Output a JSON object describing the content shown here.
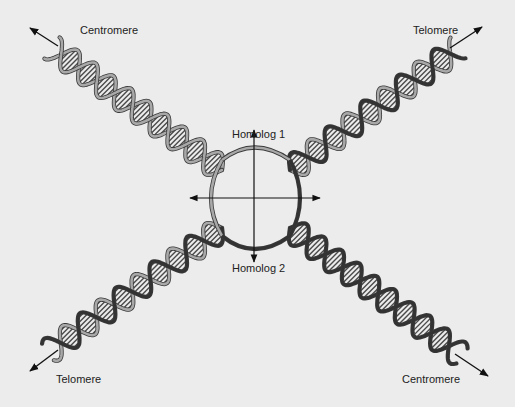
{
  "diagram": {
    "labels": {
      "top_left": "Centromere",
      "top_right": "Telomere",
      "bottom_left": "Telomere",
      "bottom_right": "Centromere",
      "homolog_1": "Homolog 1",
      "homolog_2": "Homolog 2"
    },
    "arms": [
      {
        "id": "arm-top-left",
        "end_label": "Centromere",
        "strand_shading": "light"
      },
      {
        "id": "arm-top-right",
        "end_label": "Telomere",
        "strand_shading": "mixed"
      },
      {
        "id": "arm-bottom-left",
        "end_label": "Telomere",
        "strand_shading": "mixed"
      },
      {
        "id": "arm-bottom-right",
        "end_label": "Centromere",
        "strand_shading": "dark"
      }
    ],
    "axes": {
      "vertical": "double-headed arrow",
      "horizontal": "double-headed arrow"
    },
    "colors": {
      "background": "#ececec",
      "light_strand": "#a8a8a8",
      "dark_strand": "#333333",
      "outline": "#3a3a3a",
      "hatch": "#4a4a4a",
      "text": "#222222"
    }
  }
}
